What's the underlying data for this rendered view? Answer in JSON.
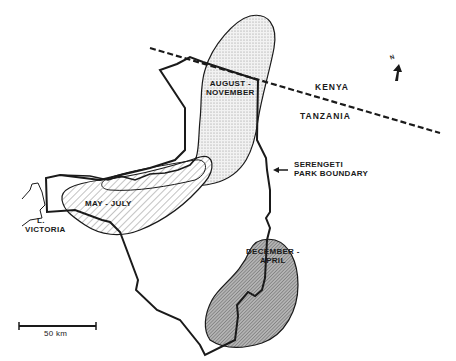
{
  "map": {
    "regions": [
      {
        "id": "august-november",
        "label_line1": "AUGUST -",
        "label_line2": "NOVEMBER",
        "pattern": "dotted",
        "fill": "#e6e6e6"
      },
      {
        "id": "may-july",
        "label": "MAY - JULY",
        "pattern": "diagonal-hatch-light",
        "fill": "#ffffff"
      },
      {
        "id": "december-april",
        "label_line1": "DECEMBER -",
        "label_line2": "APRIL",
        "pattern": "diagonal-hatch-dense",
        "fill": "#9a9a9a"
      }
    ],
    "countries": {
      "north": "KENYA",
      "south": "TANZANIA"
    },
    "park_boundary": {
      "line1": "SERENGETI",
      "line2": "PARK BOUNDARY"
    },
    "lake": {
      "line1": "L.",
      "line2": "VICTORIA"
    },
    "north_arrow": {
      "label": "N"
    },
    "scale_bar": {
      "label": "50 km"
    },
    "colors": {
      "ink": "#1a1a1a",
      "background": "#ffffff"
    }
  }
}
